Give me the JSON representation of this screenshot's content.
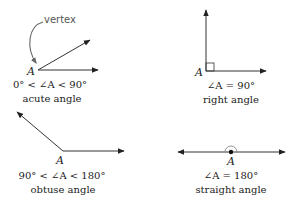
{
  "diagram": {
    "callout": {
      "label": "vertex"
    },
    "angles": [
      {
        "name": "acute",
        "vertex_label": "A",
        "condition": "0° < ∠A < 90°",
        "caption": "acute angle"
      },
      {
        "name": "right",
        "vertex_label": "A",
        "condition": "∠A = 90°",
        "caption": "right angle"
      },
      {
        "name": "obtuse",
        "vertex_label": "A",
        "condition": "90° < ∠A < 180°",
        "caption": "obtuse angle"
      },
      {
        "name": "straight",
        "vertex_label": "A",
        "condition": "∠A = 180°",
        "caption": "straight angle"
      }
    ],
    "colors": {
      "line": "#333333",
      "callout": "#666666",
      "text": "#222222"
    }
  }
}
